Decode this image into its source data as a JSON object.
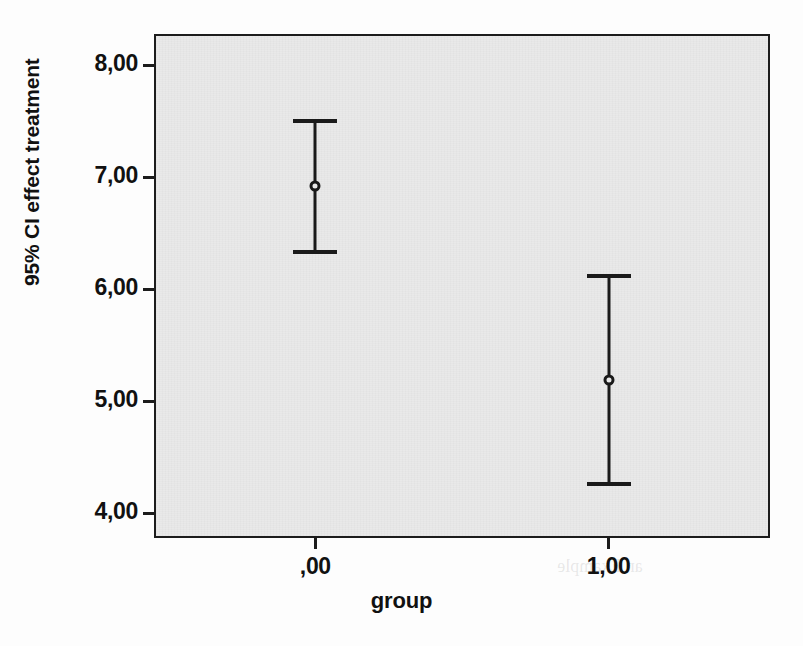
{
  "chart_data": {
    "type": "line",
    "plot_kind": "error-bar-confidence-interval",
    "title": "",
    "xlabel": "group",
    "ylabel": "95% CI effect treatment",
    "categories": [
      ",00",
      "1,00"
    ],
    "x": [
      0,
      1
    ],
    "xlim": [
      -0.55,
      1.55
    ],
    "xticks": [
      0,
      1
    ],
    "xtick_labels": [
      ",00",
      "1,00"
    ],
    "ylim": [
      3.78,
      8.28
    ],
    "yticks": [
      4,
      5,
      6,
      7,
      8
    ],
    "ytick_labels": [
      "4,00",
      "5,00",
      "6,00",
      "7,00",
      "8,00"
    ],
    "grid": false,
    "legend": null,
    "confidence_level": "95%",
    "series": [
      {
        "name": "95% CI effect treatment",
        "values": [
          6.92,
          5.19
        ],
        "ci_lower": [
          6.33,
          4.26
        ],
        "ci_upper": [
          7.5,
          6.12
        ]
      }
    ],
    "points": [
      {
        "group": ",00",
        "x": 0,
        "mean": 6.92,
        "ci_lower": 6.33,
        "ci_upper": 7.5
      },
      {
        "group": "1,00",
        "x": 1,
        "mean": 5.19,
        "ci_lower": 4.26,
        "ci_upper": 6.12
      }
    ],
    "colors": {
      "marker": "#1a1a1a",
      "line": "#1a1a1a",
      "plot_background": "#e9e9e9",
      "frame": "#1c1c1c",
      "page_background": "#ffffff"
    }
  },
  "ghost_marks": [
    {
      "text": "CI of ...",
      "x": 398,
      "y": 182,
      "size": 26
    },
    {
      "text": "Some Sample Question",
      "x": 404,
      "y": 368,
      "size": 19
    },
    {
      "text": "answer and if not, what answer was that and why",
      "x": 398,
      "y": 442,
      "size": 14
    },
    {
      "text": "an Example",
      "x": 600,
      "y": 556,
      "size": 18
    }
  ]
}
